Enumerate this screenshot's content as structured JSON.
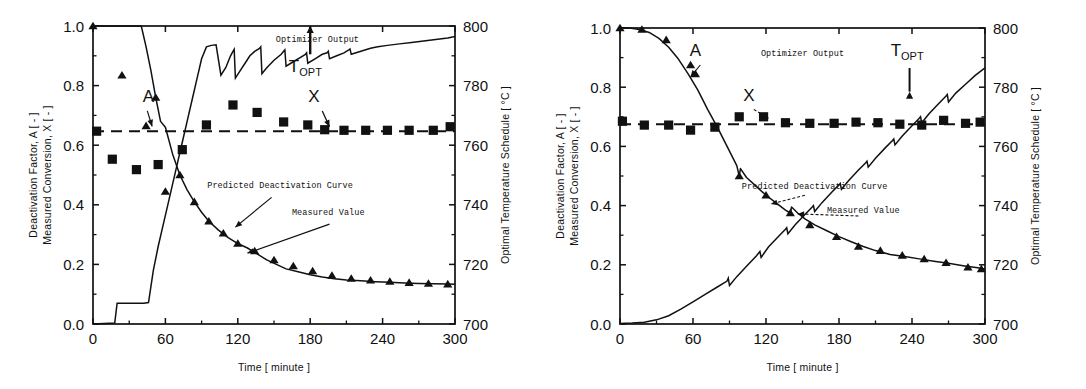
{
  "figure": {
    "panel_count": 2,
    "background": "#ffffff",
    "ink": "#111111"
  },
  "chart_data": [
    {
      "type": "line",
      "panel": "left",
      "title": "",
      "xlabel": "Time [ minute ]",
      "ylabel": "Deactivation Factor, A [ - ]",
      "ylabel2": "Measured Conversion, X [ - ]",
      "y2label": "Optimal Temperature Schedule [ °C ]",
      "xlim": [
        0,
        300
      ],
      "ylim": [
        0.0,
        1.0
      ],
      "y2lim": [
        700,
        800
      ],
      "xticks": [
        0,
        60,
        120,
        180,
        240,
        300
      ],
      "xticklabels": [
        "0",
        "60",
        "120",
        "180",
        "240",
        "300"
      ],
      "xminorticks": [
        30,
        90,
        150,
        210,
        270
      ],
      "yticks": [
        0.0,
        0.2,
        0.4,
        0.6,
        0.8,
        1.0
      ],
      "yticklabels": [
        "0.0",
        "0.2",
        "0.4",
        "0.6",
        "0.8",
        "1.0"
      ],
      "yminorticks": [
        0.1,
        0.3,
        0.5,
        0.7,
        0.9
      ],
      "y2ticks": [
        700,
        720,
        740,
        760,
        780,
        800
      ],
      "y2ticklabels": [
        "700",
        "720",
        "740",
        "760",
        "780",
        "800"
      ],
      "y2minorticks": [
        710,
        730,
        750,
        770,
        790
      ],
      "grid": false,
      "legend": "none",
      "annotations": [
        {
          "name": "optimizer-output-label",
          "text": "Optimizer Output",
          "x": 186,
          "y": 0.945
        },
        {
          "name": "topt-label",
          "text": "T",
          "subscript": "OPT",
          "x": 176,
          "y": 0.845
        },
        {
          "name": "series-label-A",
          "text": "A",
          "x": 46,
          "y": 0.745
        },
        {
          "name": "series-label-X",
          "text": "X",
          "x": 183,
          "y": 0.745
        },
        {
          "name": "predicted-curve-label",
          "text": "Predicted Deactivation Curve",
          "x": 155,
          "y": 0.455
        },
        {
          "name": "measured-value-label",
          "text": "Measured Value",
          "x": 195,
          "y": 0.365
        }
      ],
      "series": [
        {
          "name": "Deactivation Factor A (predicted curve)",
          "marker": "triangle",
          "style": "line+markers",
          "x": [
            0,
            8,
            16,
            24,
            32,
            40,
            44,
            48,
            52,
            56,
            60,
            66,
            72,
            78,
            84,
            90,
            96,
            104,
            112,
            120,
            128,
            136,
            144,
            152,
            160,
            170,
            180,
            190,
            200,
            210,
            222,
            234,
            246,
            258,
            270,
            282,
            294,
            300
          ],
          "y": [
            1.0,
            1.0,
            1.0,
            1.0,
            1.0,
            1.0,
            0.93,
            0.85,
            0.76,
            0.68,
            0.66,
            0.57,
            0.5,
            0.45,
            0.41,
            0.375,
            0.345,
            0.315,
            0.29,
            0.27,
            0.255,
            0.235,
            0.215,
            0.2,
            0.185,
            0.175,
            0.165,
            0.158,
            0.152,
            0.148,
            0.145,
            0.142,
            0.14,
            0.138,
            0.136,
            0.135,
            0.134,
            0.133
          ],
          "marker_x": [
            0,
            24,
            44,
            52,
            60,
            72,
            84,
            96,
            108,
            120,
            134,
            150,
            166,
            182,
            198,
            214,
            230,
            246,
            262,
            278,
            294
          ],
          "marker_y": [
            1.0,
            0.835,
            0.665,
            0.76,
            0.445,
            0.5,
            0.41,
            0.345,
            0.305,
            0.27,
            0.245,
            0.215,
            0.195,
            0.178,
            0.163,
            0.153,
            0.147,
            0.143,
            0.139,
            0.136,
            0.134
          ]
        },
        {
          "name": "Measured Conversion X",
          "marker": "square",
          "style": "dashed-line+markers",
          "level": 0.647,
          "marker_x": [
            3,
            16,
            36,
            54,
            74,
            94,
            116,
            136,
            158,
            178,
            192,
            208,
            226,
            244,
            262,
            282,
            296
          ],
          "marker_y": [
            0.647,
            0.553,
            0.518,
            0.535,
            0.585,
            0.668,
            0.735,
            0.71,
            0.678,
            0.668,
            0.652,
            0.65,
            0.65,
            0.65,
            0.65,
            0.65,
            0.662
          ]
        },
        {
          "name": "Optimizer Output (Optimal Temperature Schedule)",
          "axis": "right",
          "style": "sawtooth-line",
          "x": [
            0,
            18,
            20,
            22,
            26,
            30,
            34,
            38,
            42,
            46,
            50,
            54,
            58,
            62,
            66,
            70,
            74,
            78,
            82,
            86,
            90,
            94,
            98,
            102,
            106,
            110,
            114,
            116,
            117,
            118,
            122,
            126,
            130,
            134,
            138,
            139,
            140,
            144,
            150,
            156,
            158,
            159,
            160,
            166,
            172,
            176,
            177,
            178,
            184,
            190,
            194,
            195,
            196,
            202,
            208,
            212,
            213,
            214,
            222,
            230,
            236,
            244,
            254,
            264,
            274,
            284,
            294,
            300
          ],
          "y_temp": [
            700,
            700.3,
            707,
            707,
            707,
            707,
            707,
            707,
            707,
            707.2,
            718,
            726,
            733,
            740,
            747,
            754,
            761,
            768,
            775,
            782,
            789,
            793,
            793.5,
            793.7,
            783.5,
            786,
            790,
            791.5,
            792.2,
            782.5,
            785,
            787.5,
            790,
            791.5,
            792.5,
            793,
            784,
            786,
            788.5,
            790.5,
            791.5,
            792,
            786.5,
            788,
            789.5,
            790.5,
            791,
            787.5,
            789,
            790.5,
            791,
            791.5,
            789,
            790,
            791,
            792,
            792.3,
            790.5,
            791.5,
            792.5,
            793,
            793.5,
            794,
            794.5,
            795,
            795.5,
            796,
            796.5
          ]
        }
      ]
    },
    {
      "type": "line",
      "panel": "right",
      "title": "",
      "xlabel": "Time [ minute ]",
      "ylabel": "Deactivation Factor, A [ - ]",
      "ylabel2": "Measured Conversion, X [ - ]",
      "y2label": "Optimal Temperature Schedule [ °C ]",
      "xlim": [
        0,
        300
      ],
      "ylim": [
        0.0,
        1.0
      ],
      "y2lim": [
        700,
        800
      ],
      "xticks": [
        0,
        60,
        120,
        180,
        240,
        300
      ],
      "xticklabels": [
        "0",
        "60",
        "120",
        "180",
        "240",
        "300"
      ],
      "xminorticks": [
        30,
        90,
        150,
        210,
        270
      ],
      "yticks": [
        0.0,
        0.2,
        0.4,
        0.6,
        0.8,
        1.0
      ],
      "yticklabels": [
        "0.0",
        "0.2",
        "0.4",
        "0.6",
        "0.8",
        "1.0"
      ],
      "yminorticks": [
        0.1,
        0.3,
        0.5,
        0.7,
        0.9
      ],
      "y2ticks": [
        700,
        720,
        740,
        760,
        780,
        800
      ],
      "y2ticklabels": [
        "700",
        "720",
        "740",
        "760",
        "780",
        "800"
      ],
      "y2minorticks": [
        710,
        730,
        750,
        770,
        790
      ],
      "grid": false,
      "legend": "none",
      "annotations": [
        {
          "name": "optimizer-output-label",
          "text": "Optimizer Output",
          "x": 150,
          "y": 0.905
        },
        {
          "name": "topt-label",
          "text": "T",
          "subscript": "OPT",
          "x": 236,
          "y": 0.905
        },
        {
          "name": "series-label-A",
          "text": "A",
          "x": 62,
          "y": 0.905
        },
        {
          "name": "series-label-X",
          "text": "X",
          "x": 106,
          "y": 0.755
        },
        {
          "name": "predicted-curve-label",
          "text": "Predicted Deactivation Curve",
          "x": 160,
          "y": 0.455
        },
        {
          "name": "measured-value-label",
          "text": "Measured Value",
          "x": 200,
          "y": 0.375
        }
      ],
      "series": [
        {
          "name": "Deactivation Factor A (predicted curve)",
          "marker": "triangle",
          "style": "line+markers",
          "x": [
            0,
            8,
            16,
            24,
            32,
            40,
            48,
            56,
            64,
            72,
            80,
            88,
            96,
            98,
            99,
            104,
            112,
            120,
            128,
            136,
            140,
            141,
            146,
            152,
            160,
            170,
            180,
            190,
            200,
            210,
            222,
            234,
            246,
            258,
            270,
            282,
            294,
            300
          ],
          "y": [
            1.0,
            1.0,
            0.995,
            0.985,
            0.965,
            0.935,
            0.895,
            0.845,
            0.79,
            0.725,
            0.665,
            0.6,
            0.535,
            0.5,
            0.525,
            0.495,
            0.465,
            0.435,
            0.41,
            0.385,
            0.375,
            0.395,
            0.375,
            0.355,
            0.335,
            0.315,
            0.295,
            0.278,
            0.262,
            0.248,
            0.235,
            0.228,
            0.22,
            0.212,
            0.205,
            0.197,
            0.19,
            0.186
          ],
          "marker_x": [
            0,
            18,
            38,
            58,
            62,
            78,
            98,
            120,
            140,
            156,
            178,
            196,
            214,
            232,
            250,
            268,
            286,
            297
          ],
          "marker_y": [
            1.0,
            0.995,
            0.96,
            0.875,
            0.845,
            0.665,
            0.5,
            0.435,
            0.375,
            0.335,
            0.295,
            0.262,
            0.248,
            0.232,
            0.22,
            0.207,
            0.192,
            0.186
          ]
        },
        {
          "name": "Measured Conversion X",
          "marker": "square",
          "style": "dashed-line+markers",
          "level": 0.675,
          "marker_x": [
            2,
            20,
            40,
            58,
            78,
            98,
            118,
            136,
            156,
            176,
            194,
            212,
            230,
            248,
            266,
            284,
            296
          ],
          "marker_y": [
            0.685,
            0.672,
            0.672,
            0.655,
            0.665,
            0.7,
            0.7,
            0.68,
            0.678,
            0.678,
            0.682,
            0.68,
            0.675,
            0.672,
            0.688,
            0.678,
            0.682
          ]
        },
        {
          "name": "Optimizer Output (Optimal Temperature Schedule)",
          "axis": "right",
          "style": "sawtooth-line",
          "x": [
            0,
            10,
            20,
            30,
            40,
            50,
            60,
            70,
            80,
            88,
            89,
            90,
            96,
            104,
            112,
            114,
            115,
            116,
            122,
            130,
            136,
            137,
            138,
            144,
            152,
            158,
            159,
            160,
            166,
            174,
            180,
            181,
            182,
            188,
            196,
            202,
            203,
            204,
            210,
            218,
            224,
            225,
            226,
            232,
            240,
            246,
            247,
            248,
            254,
            262,
            268,
            269,
            270,
            276,
            284,
            292,
            300
          ],
          "y_temp": [
            700.2,
            700.3,
            700.6,
            701.4,
            702.8,
            705,
            707.5,
            710,
            712.5,
            714.5,
            715.5,
            713,
            716,
            719.5,
            723,
            724,
            724.5,
            722.5,
            726,
            729.5,
            732,
            732.5,
            730.5,
            733.5,
            737,
            739.5,
            740,
            738,
            741,
            744.5,
            747,
            747.5,
            745.5,
            748.5,
            752,
            754.5,
            755,
            753,
            756,
            759.5,
            762,
            762.5,
            760.5,
            763.5,
            767,
            769.5,
            770,
            768,
            771,
            774.5,
            777,
            777.5,
            775,
            778,
            781,
            784,
            786.5
          ]
        }
      ]
    }
  ]
}
